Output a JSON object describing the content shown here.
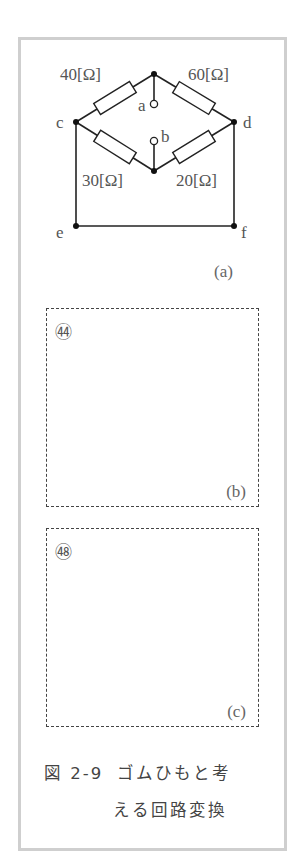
{
  "figure": {
    "caption_line1_prefix": "図 2-9",
    "caption_line1_text": "ゴムひもと考",
    "caption_line2_text": "える回路変換"
  },
  "circuit": {
    "subfigure_label": "(a)",
    "resistors": [
      {
        "label": "40[Ω]",
        "between": [
          "c",
          "top"
        ]
      },
      {
        "label": "60[Ω]",
        "between": [
          "top",
          "d"
        ]
      },
      {
        "label": "30[Ω]",
        "between": [
          "c",
          "bottom"
        ]
      },
      {
        "label": "20[Ω]",
        "between": [
          "bottom",
          "d"
        ]
      }
    ],
    "nodes": {
      "c": "c",
      "d": "d",
      "e": "e",
      "f": "f"
    },
    "terminals": {
      "a": "a",
      "b": "b"
    }
  },
  "answer_boxes": [
    {
      "number": "㊹",
      "label": "(b)"
    },
    {
      "number": "㊽",
      "label": "(c)"
    }
  ],
  "colors": {
    "line": "#222222",
    "frame": "#cfcfcf",
    "text": "#555555"
  }
}
